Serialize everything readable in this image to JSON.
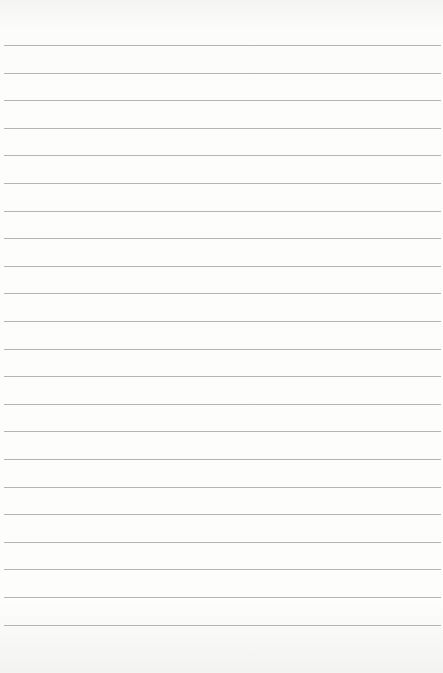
{
  "paper": {
    "type": "lined-notepad",
    "background_color": "#fbfbfa",
    "line_color": "#b4b4b2",
    "line_count": 22,
    "first_line_y": 45,
    "line_spacing": 27.6
  }
}
